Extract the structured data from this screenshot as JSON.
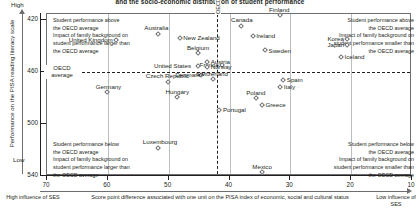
{
  "title": "and the socio-economic distribution of student performance",
  "axis": {
    "y_title": "Performance on the PISA reading literacy scale",
    "y_high": "High",
    "y_low": "Low",
    "y_ticks": [
      "540",
      "500",
      "460",
      "420"
    ],
    "x_title": "Score point difference associated with one unit on the PISA index of economic, social and cultural status",
    "x_ticks": [
      "70",
      "60",
      "50",
      "40",
      "30",
      "20",
      "10"
    ],
    "x_end_left": "High influence\nof SES",
    "x_end_right": "Low influence\nof SES"
  },
  "reference_lines": {
    "horizontal_label": "OECD\naverage",
    "vertical_label": "OECD average",
    "horizontal_value": 500,
    "vertical_value": 42
  },
  "quadrants": {
    "top_left": "Student performance above\nthe OECD average\nImpact of family background on\nstudent performance larger than\nthe OECD average",
    "top_right": "Student performance above\nthe OECD average\nImpact of family background on\nstudent performance smaller than\nthe OECD average",
    "bottom_left": "Student performance below\nthe OECD average\nImpact of family background on\nstudent performance larger than\nthe OECD average",
    "bottom_right": "Student performance below\nthe OECD average\nImpact of family background on\nstudent performance smaller than\nthe OECD average"
  },
  "chart_data": {
    "type": "scatter",
    "title": "and the socio-economic distribution of student performance",
    "xlabel": "Score point difference associated with one unit on the PISA index of economic, social and cultural status",
    "ylabel": "Performance on the PISA reading literacy scale",
    "xlim": [
      70,
      10
    ],
    "ylim": [
      420,
      545
    ],
    "x_ticks": [
      70,
      60,
      50,
      40,
      30,
      20,
      10
    ],
    "y_ticks": [
      420,
      460,
      500,
      540
    ],
    "grid": true,
    "x_axis_reversed": true,
    "reference_lines": {
      "y": 500,
      "x": 42
    },
    "points": [
      {
        "name": "Finland",
        "x": 31.5,
        "y": 543,
        "label_pos": "above"
      },
      {
        "name": "Canada",
        "x": 38.0,
        "y": 535,
        "label_pos": "above"
      },
      {
        "name": "Australia",
        "x": 51.5,
        "y": 529,
        "label_pos": "above"
      },
      {
        "name": "New Zealand",
        "x": 48.0,
        "y": 526,
        "label_pos": "right"
      },
      {
        "name": "Ireland",
        "x": 36.0,
        "y": 527,
        "label_pos": "right"
      },
      {
        "name": "Korea",
        "x": 20.5,
        "y": 525,
        "label_pos": "left"
      },
      {
        "name": "United Kingdom",
        "x": 58.5,
        "y": 524,
        "label_pos": "left"
      },
      {
        "name": "Japan",
        "x": 20.5,
        "y": 520,
        "label_pos": "left"
      },
      {
        "name": "Sweden",
        "x": 34.0,
        "y": 516,
        "label_pos": "right"
      },
      {
        "name": "Belgium",
        "x": 45.0,
        "y": 514,
        "label_pos": "above"
      },
      {
        "name": "Iceland",
        "x": 21.5,
        "y": 511,
        "label_pos": "right"
      },
      {
        "name": "Austria",
        "x": 43.5,
        "y": 507,
        "label_pos": "right"
      },
      {
        "name": "France",
        "x": 41.0,
        "y": 505,
        "label_pos": "left"
      },
      {
        "name": "United States",
        "x": 45.0,
        "y": 504,
        "label_pos": "left"
      },
      {
        "name": "Norway",
        "x": 43.5,
        "y": 503,
        "label_pos": "right"
      },
      {
        "name": "Denmark",
        "x": 44.5,
        "y": 497,
        "label_pos": "left"
      },
      {
        "name": "Switzerland",
        "x": 42.5,
        "y": 494,
        "label_pos": "above"
      },
      {
        "name": "Spain",
        "x": 31.0,
        "y": 493,
        "label_pos": "right"
      },
      {
        "name": "Italy",
        "x": 31.5,
        "y": 488,
        "label_pos": "right"
      },
      {
        "name": "Germany",
        "x": 60.0,
        "y": 484,
        "label_pos": "above"
      },
      {
        "name": "Czech Republic",
        "x": 50.0,
        "y": 492,
        "label_pos": "above"
      },
      {
        "name": "Poland",
        "x": 35.5,
        "y": 479,
        "label_pos": "above"
      },
      {
        "name": "Hungary",
        "x": 48.5,
        "y": 480,
        "label_pos": "above"
      },
      {
        "name": "Greece",
        "x": 34.5,
        "y": 474,
        "label_pos": "right"
      },
      {
        "name": "Portugal",
        "x": 41.5,
        "y": 470,
        "label_pos": "right"
      },
      {
        "name": "Luxembourg",
        "x": 51.5,
        "y": 441,
        "label_pos": "above"
      },
      {
        "name": "Mexico",
        "x": 34.5,
        "y": 422,
        "label_pos": "above"
      }
    ]
  }
}
